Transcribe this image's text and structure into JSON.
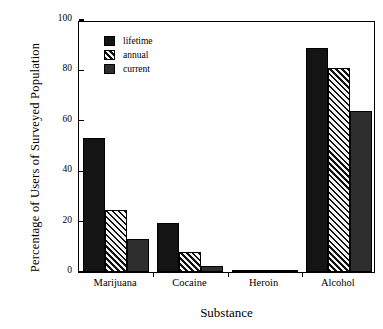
{
  "chart_data": {
    "type": "bar",
    "title": "",
    "xlabel": "Substance",
    "ylabel": "Percentage of Users of Surveyed Population",
    "categories": [
      "Marijuana",
      "Cocaine",
      "Heroin",
      "Alcohol"
    ],
    "series": [
      {
        "name": "lifetime",
        "values": [
          53,
          19.5,
          0.7,
          89
        ],
        "fill": "solid"
      },
      {
        "name": "annual",
        "values": [
          24.5,
          8,
          0.4,
          81
        ],
        "fill": "hatch"
      },
      {
        "name": "current",
        "values": [
          13,
          2.5,
          0.3,
          64
        ],
        "fill": "gray"
      }
    ],
    "ylim": [
      0,
      100
    ],
    "yticks": [
      0,
      20,
      40,
      60,
      80,
      100
    ],
    "ytick_labels": [
      "0",
      "20",
      "40",
      "60",
      "80",
      "100"
    ],
    "grid": false,
    "legend_position": "upper-left-inside",
    "colors": {
      "solid": "#141414",
      "hatch": "#111111",
      "gray": "#2e2e2e",
      "axis": "#000000",
      "background": "#ffffff"
    }
  }
}
